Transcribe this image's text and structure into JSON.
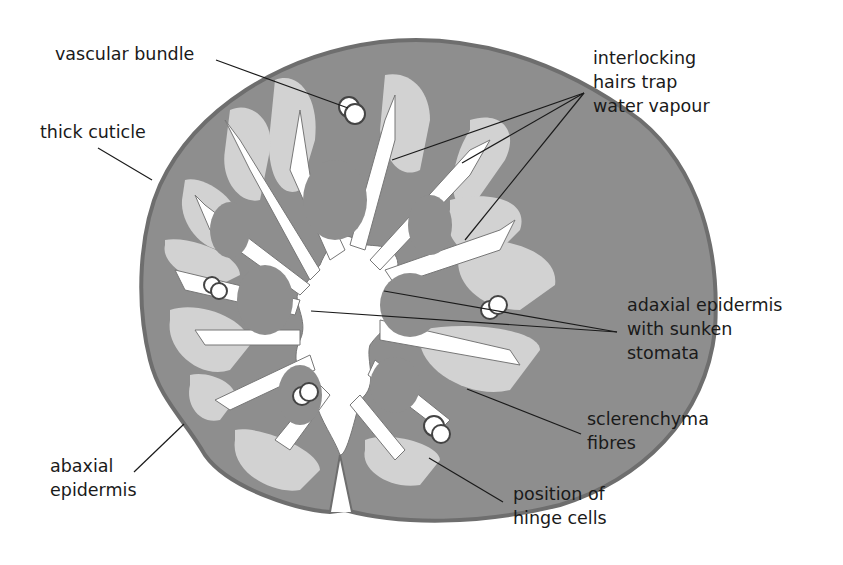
{
  "diagram": {
    "colors": {
      "mesophyll": "#8e8e8e",
      "sclerenchyma": "#d2d2d2",
      "cavity": "#ffffff",
      "cuticle": "#6e6e6e",
      "leader_line": "#1a1a1a",
      "text": "#1a1a1a"
    },
    "labels": {
      "vascular_bundle": [
        "vascular bundle"
      ],
      "thick_cuticle": [
        "thick cuticle"
      ],
      "interlocking_hairs": [
        "interlocking",
        "hairs trap",
        "water vapour"
      ],
      "adaxial_epidermis": [
        "adaxial epidermis",
        "with sunken",
        "stomata"
      ],
      "sclerenchyma": [
        "sclerenchyma",
        "fibres"
      ],
      "abaxial_epidermis": [
        "abaxial",
        "epidermis"
      ],
      "hinge_cells": [
        "position of",
        "hinge cells"
      ]
    }
  }
}
